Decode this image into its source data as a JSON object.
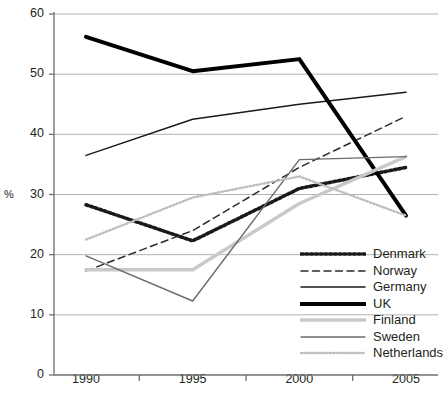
{
  "chart_data": {
    "type": "line",
    "title": "",
    "subtitle": "",
    "xlabel": "",
    "ylabel": "%",
    "x": [
      1990,
      1995,
      2000,
      2005
    ],
    "categories": [
      "1990",
      "1995",
      "2000",
      "2005"
    ],
    "xtick_labels": [
      "1990",
      "1995",
      "2000",
      "2005"
    ],
    "ytick_labels": [
      "0",
      "10",
      "20",
      "30",
      "40",
      "50",
      "60"
    ],
    "yticks": [
      0,
      10,
      20,
      30,
      40,
      50,
      60
    ],
    "ylim": [
      0,
      60
    ],
    "xlim": [
      1988.5,
      2006.5
    ],
    "grid": "horizontal",
    "legend_position": "inside-bottom-right",
    "series": [
      {
        "name": "Denmark",
        "values": [
          28.3,
          22.3,
          31.0,
          34.5
        ],
        "color": "#1a1a1a",
        "style": "dotted-bold",
        "width": 3.6
      },
      {
        "name": "Norway",
        "values": [
          17.3,
          24.0,
          34.5,
          43.0
        ],
        "color": "#2b2b2b",
        "style": "dashed",
        "width": 1.5
      },
      {
        "name": "Germany",
        "values": [
          36.5,
          42.5,
          45.0,
          47.0
        ],
        "color": "#1a1a1a",
        "style": "solid",
        "width": 1.5
      },
      {
        "name": "UK",
        "values": [
          56.2,
          50.5,
          52.5,
          26.5
        ],
        "color": "#000000",
        "style": "solid-bold",
        "width": 4.0
      },
      {
        "name": "Finland",
        "values": [
          17.5,
          17.5,
          28.5,
          36.3
        ],
        "color": "#c9c9c9",
        "style": "solid",
        "width": 3.4
      },
      {
        "name": "Sweden",
        "values": [
          19.8,
          12.3,
          35.8,
          36.3
        ],
        "color": "#6b6b6b",
        "style": "solid",
        "width": 1.4
      },
      {
        "name": "Netherlands",
        "values": [
          22.5,
          29.5,
          33.0,
          26.5
        ],
        "color": "#bdbdbd",
        "style": "dotted",
        "width": 2.4
      }
    ]
  },
  "legend": {
    "items": [
      {
        "label": "Denmark"
      },
      {
        "label": "Norway"
      },
      {
        "label": "Germany"
      },
      {
        "label": "UK"
      },
      {
        "label": "Finland"
      },
      {
        "label": "Sweden"
      },
      {
        "label": "Netherlands"
      }
    ]
  },
  "colors": {
    "axis": "#6f6f6f",
    "grid": "#b3b3b3",
    "text": "#231f20",
    "background": "#ffffff"
  }
}
